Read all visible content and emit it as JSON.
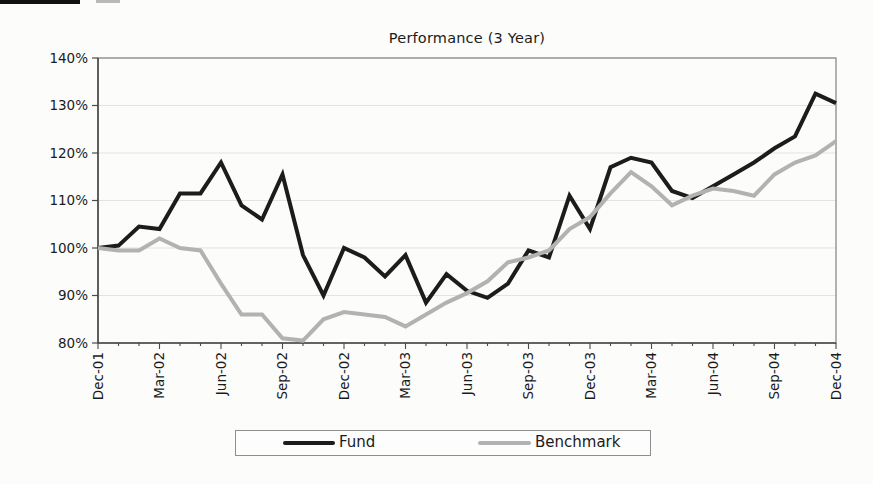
{
  "chart_data": {
    "type": "line",
    "title": "Performance (3 Year)",
    "xlabel": "",
    "ylabel": "",
    "y_min": 80,
    "y_max": 140,
    "y_step": 10,
    "y_tick_labels": [
      "140%",
      "130%",
      "120%",
      "110%",
      "100%",
      "90%",
      "80%"
    ],
    "x_tick_labels": [
      "Dec-01",
      "Mar-02",
      "Jun-02",
      "Sep-02",
      "Dec-02",
      "Mar-03",
      "Jun-03",
      "Sep-03",
      "Dec-03",
      "Mar-04",
      "Jun-04",
      "Sep-04",
      "Dec-04"
    ],
    "x_months_per_tick": 3,
    "grid": true,
    "legend_position": "bottom",
    "colors": {
      "fund": "#1c1c1c",
      "benchmark": "#b2b2b2",
      "gridline": "#e3e3e1",
      "frame": "#8a8a8a",
      "axis": "#4a4a4a",
      "text": "#1b1b1b"
    },
    "series": [
      {
        "name": "Fund",
        "color": "#1c1c1c",
        "values": [
          100,
          100.5,
          104.5,
          104,
          111.5,
          111.5,
          118,
          109,
          106,
          115.5,
          98.5,
          90,
          100,
          98,
          94,
          98.5,
          88.5,
          94.5,
          91,
          89.5,
          92.5,
          99.5,
          98,
          111,
          104,
          117,
          119,
          118,
          112,
          110.5,
          113,
          115.5,
          118,
          121,
          123.5,
          132.5,
          130.5
        ]
      },
      {
        "name": "Benchmark",
        "color": "#b2b2b2",
        "values": [
          100,
          99.5,
          99.5,
          102,
          100,
          99.5,
          92.5,
          86,
          86,
          81,
          80.5,
          85,
          86.5,
          86,
          85.5,
          83.5,
          86,
          88.5,
          90.5,
          93,
          97,
          98,
          99.5,
          104,
          106.5,
          111.5,
          116,
          113,
          109,
          111,
          112.5,
          112,
          111,
          115.5,
          118,
          119.5,
          122.5
        ]
      }
    ]
  },
  "legend": {
    "items": [
      {
        "label": "Fund",
        "color": "#1c1c1c"
      },
      {
        "label": "Benchmark",
        "color": "#b2b2b2"
      }
    ]
  }
}
